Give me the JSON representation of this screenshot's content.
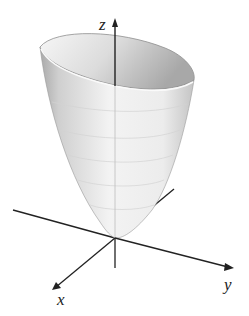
{
  "figure": {
    "surface": "paraboloid",
    "axes": {
      "z": {
        "label": "z"
      },
      "x": {
        "label": "x"
      },
      "y": {
        "label": "y"
      }
    },
    "colors": {
      "axis": "#222222",
      "surface_light": "#f4f4f4",
      "surface_dark": "#b8b8b8",
      "rim": "#9a9a9a",
      "contour": "#d6d6d6"
    }
  }
}
